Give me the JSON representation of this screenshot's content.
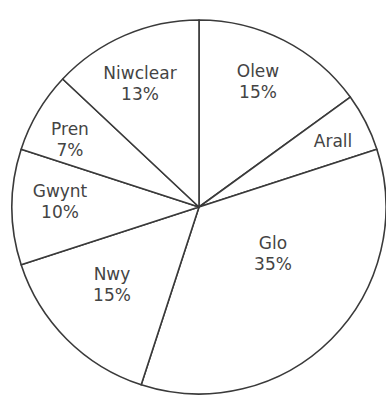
{
  "chart_data": {
    "type": "pie",
    "title": "",
    "start_angle_deg": 0,
    "direction": "clockwise",
    "slices": [
      {
        "name": "Olew",
        "value": 15,
        "label": "Olew",
        "pct_label": "15%",
        "label_pos": [
          258,
          82
        ]
      },
      {
        "name": "Arall",
        "value": 5,
        "label": "Arall",
        "pct_label": "",
        "label_pos": [
          333,
          141
        ]
      },
      {
        "name": "Glo",
        "value": 35,
        "label": "Glo",
        "pct_label": "35%",
        "label_pos": [
          273,
          254
        ]
      },
      {
        "name": "Nwy",
        "value": 15,
        "label": "Nwy",
        "pct_label": "15%",
        "label_pos": [
          112,
          285
        ]
      },
      {
        "name": "Gwynt",
        "value": 10,
        "label": "Gwynt",
        "pct_label": "10%",
        "label_pos": [
          60,
          202
        ]
      },
      {
        "name": "Pren",
        "value": 7,
        "label": "Pren",
        "pct_label": "7%",
        "label_pos": [
          70,
          140
        ]
      },
      {
        "name": "Niwclear",
        "value": 13,
        "label": "Niwclear",
        "pct_label": "13%",
        "label_pos": [
          140,
          84
        ]
      }
    ],
    "center": [
      199,
      207
    ],
    "radius": 187,
    "stroke_color": "#3a3a3a",
    "fill_color": "#ffffff",
    "label_color": "#444444"
  }
}
